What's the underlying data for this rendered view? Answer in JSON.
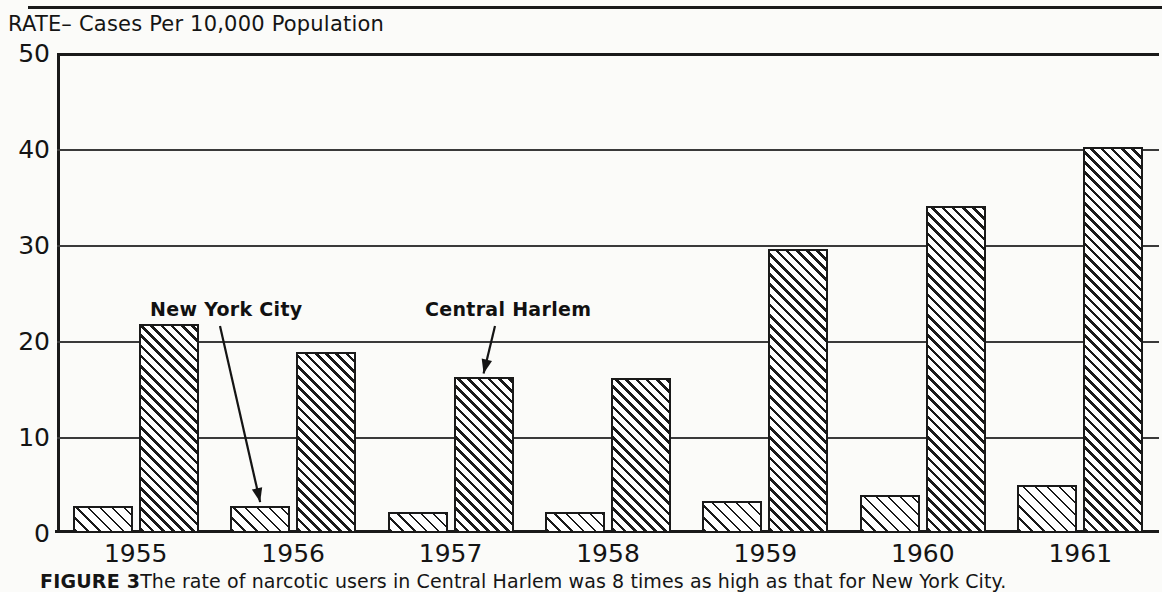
{
  "axis_title": "RATE– Cases Per 10,000 Population",
  "caption": {
    "figure_label": "FIGURE 3",
    "text": "The rate of narcotic users in Central Harlem was 8 times as high as that for  New York City."
  },
  "annotations": [
    {
      "label": "New York City",
      "points_to_series": "New York City",
      "points_to_category": "1956"
    },
    {
      "label": "Central Harlem",
      "points_to_series": "Central Harlem",
      "points_to_category": "1957"
    }
  ],
  "chart_data": {
    "type": "bar",
    "title": "",
    "subtitle": "",
    "xlabel": "",
    "ylabel": "RATE– Cases Per 10,000 Population",
    "categories": [
      "1955",
      "1956",
      "1957",
      "1958",
      "1959",
      "1960",
      "1961"
    ],
    "series": [
      {
        "name": "New York City",
        "values": [
          2.8,
          2.8,
          2.2,
          2.2,
          3.3,
          4.0,
          5.0
        ]
      },
      {
        "name": "Central Harlem",
        "values": [
          21.8,
          18.9,
          16.2,
          16.1,
          29.6,
          34.1,
          40.2
        ]
      }
    ],
    "ylim": [
      0,
      50
    ],
    "yticks": [
      0,
      10,
      20,
      30,
      40,
      50
    ],
    "ytick_labels": [
      "0",
      "10",
      "20",
      "30",
      "40",
      "50"
    ],
    "grid": true,
    "grid_axis": "y",
    "legend": "annotations",
    "legend_position": "in-plot-callouts",
    "colors": {
      "ink": "#1a1a1a",
      "background": "#fbfbf9",
      "new_york_city_fill": "hatch-sparse-45deg",
      "central_harlem_fill": "hatch-dense-45deg"
    }
  }
}
